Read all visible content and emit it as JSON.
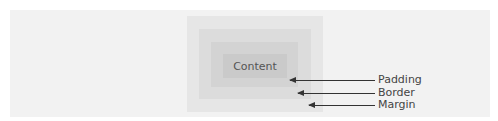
{
  "diagram": {
    "layers": [
      {
        "name": "Margin",
        "color": "#e6e6e6"
      },
      {
        "name": "Border",
        "color": "#dcdcdc"
      },
      {
        "name": "Padding",
        "color": "#d3d3d3"
      },
      {
        "name": "Content",
        "color": "#cacaca"
      }
    ],
    "content_label": "Content",
    "callouts": {
      "padding": "Padding",
      "border": "Border",
      "margin": "Margin"
    }
  }
}
